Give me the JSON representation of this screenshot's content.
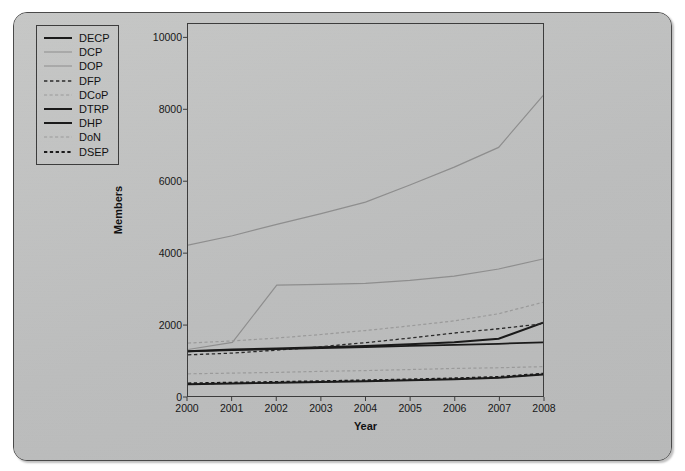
{
  "chart_data": {
    "type": "line",
    "title": "",
    "xlabel": "Year",
    "ylabel": "Members",
    "x": [
      2000,
      2001,
      2002,
      2003,
      2004,
      2005,
      2006,
      2007,
      2008
    ],
    "xtick_labels": [
      "2000",
      "2001",
      "2002",
      "2003",
      "2004",
      "2005",
      "2006",
      "2007",
      "2008"
    ],
    "ytick_labels": [
      "0",
      "2000",
      "4000",
      "6000",
      "8000",
      "10000"
    ],
    "yticks": [
      0,
      2000,
      4000,
      6000,
      8000,
      10000
    ],
    "ylim": [
      0,
      10400
    ],
    "xlim": [
      2000,
      2008
    ],
    "grid": false,
    "legend_position": "top-left-inside",
    "series": [
      {
        "name": "DECP",
        "style": "solid",
        "width": 2.0,
        "color": "#1a1a1a",
        "values": [
          1250,
          1300,
          1330,
          1360,
          1400,
          1450,
          1500,
          1600,
          2050
        ]
      },
      {
        "name": "DCP",
        "style": "solid",
        "width": 1.2,
        "color": "#8e8e8e",
        "values": [
          1300,
          1500,
          3100,
          3120,
          3150,
          3230,
          3350,
          3550,
          3830
        ]
      },
      {
        "name": "DOP",
        "style": "solid",
        "width": 1.2,
        "color": "#8e8e8e",
        "values": [
          4220,
          4480,
          4800,
          5100,
          5420,
          5900,
          6400,
          6950,
          8400
        ]
      },
      {
        "name": "DFP",
        "style": "dashed",
        "width": 1.3,
        "color": "#2a2a2a",
        "values": [
          1150,
          1200,
          1280,
          1380,
          1490,
          1620,
          1760,
          1880,
          2020
        ]
      },
      {
        "name": "DCoP",
        "style": "dashed",
        "width": 1.2,
        "color": "#9a9a9a",
        "values": [
          1480,
          1540,
          1620,
          1720,
          1830,
          1960,
          2100,
          2300,
          2620
        ]
      },
      {
        "name": "DTRP",
        "style": "solid",
        "width": 2.0,
        "color": "#1a1a1a",
        "values": [
          330,
          350,
          370,
          390,
          410,
          440,
          470,
          510,
          600
        ]
      },
      {
        "name": "DHP",
        "style": "solid",
        "width": 1.8,
        "color": "#1a1a1a",
        "values": [
          1250,
          1280,
          1310,
          1340,
          1370,
          1400,
          1430,
          1460,
          1500
        ]
      },
      {
        "name": "DoN",
        "style": "dashed",
        "width": 1.2,
        "color": "#9a9a9a",
        "values": [
          620,
          640,
          660,
          690,
          710,
          740,
          770,
          790,
          820
        ]
      },
      {
        "name": "DSEP",
        "style": "dotted-dashed",
        "width": 2.2,
        "color": "#1a1a1a",
        "values": [
          350,
          370,
          390,
          410,
          435,
          460,
          490,
          530,
          620
        ]
      }
    ]
  },
  "legend": {
    "items": [
      {
        "label": "DECP"
      },
      {
        "label": "DCP"
      },
      {
        "label": "DOP"
      },
      {
        "label": "DFP"
      },
      {
        "label": "DCoP"
      },
      {
        "label": "DTRP"
      },
      {
        "label": "DHP"
      },
      {
        "label": "DoN"
      },
      {
        "label": "DSEP"
      }
    ]
  },
  "colors": {
    "page_background": "#ffffff",
    "card_background": "#bfc0c0",
    "axis": "#3c3c3c",
    "text": "#171717",
    "dark_series": "#1a1a1a",
    "light_series": "#8e8e8e"
  }
}
